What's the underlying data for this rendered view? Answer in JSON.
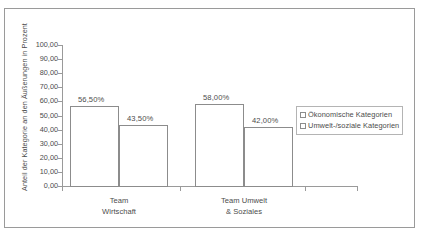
{
  "chart_data": {
    "type": "bar",
    "title": "",
    "xlabel": "",
    "ylabel": "Anteil der Kategorie an den Äußerungen in Prozent",
    "ylim": [
      0,
      100
    ],
    "grid": false,
    "legend_position": "right",
    "categories": [
      "Team Wirtschaft",
      "Team Umwelt & Soziales"
    ],
    "category_lines": [
      [
        "Team",
        "Wirtschaft"
      ],
      [
        "Team Umwelt",
        "& Soziales"
      ]
    ],
    "y_tick_labels": [
      "100,00",
      "90,00",
      "80,00",
      "70,00",
      "60,00",
      "50,00",
      "40,00",
      "30,00",
      "20,00",
      "10,00",
      "0,00"
    ],
    "y_tick_values": [
      100,
      90,
      80,
      70,
      60,
      50,
      40,
      30,
      20,
      10,
      0
    ],
    "series": [
      {
        "name": "Ökonomische Kategorien",
        "values": [
          56.5,
          58.0
        ],
        "value_labels": [
          "56,50%",
          "58,00%"
        ]
      },
      {
        "name": "Umwelt-/soziale Kategorien",
        "values": [
          43.5,
          42.0
        ],
        "value_labels": [
          "43,50%",
          "42,00%"
        ]
      }
    ],
    "colors": {
      "bar_fill": "#ffffff",
      "bar_stroke": "#8c8c8c",
      "axis": "#9a9a9a",
      "text": "#4c4c4c",
      "frame": "#9a9a9a",
      "background": "#ffffff"
    }
  },
  "legend": {
    "items": [
      {
        "label": "Ökonomische Kategorien"
      },
      {
        "label": "Umwelt-/soziale Kategorien"
      }
    ]
  },
  "axis": {
    "y_title": "Anteil der Kategorie an den Äußerungen in Prozent"
  }
}
